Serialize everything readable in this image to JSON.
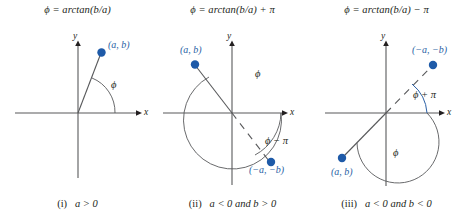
{
  "figure": {
    "accent_color": "#2a5fa5",
    "line_color": "#58595b",
    "text_color": "#231f20"
  },
  "panels": [
    {
      "id": "panel-1",
      "title": "ϕ = arctan(b/a)",
      "caption_index": "(i)",
      "caption_condition": "a > 0",
      "axis_x_label": "x",
      "axis_y_label": "y",
      "points": [
        {
          "name": "point-ab",
          "label": "(a, b)"
        }
      ],
      "angles": [
        {
          "name": "angle-phi",
          "label": "ϕ"
        }
      ]
    },
    {
      "id": "panel-2",
      "title": "ϕ = arctan(b/a) + π",
      "caption_index": "(ii)",
      "caption_condition": "a < 0 and b > 0",
      "axis_x_label": "x",
      "axis_y_label": "y",
      "points": [
        {
          "name": "point-ab",
          "label": "(a, b)"
        },
        {
          "name": "point-neg-ab",
          "label": "(−a, −b)"
        }
      ],
      "angles": [
        {
          "name": "angle-phi",
          "label": "ϕ"
        },
        {
          "name": "angle-phi-minus-pi",
          "label": "ϕ − π"
        }
      ]
    },
    {
      "id": "panel-3",
      "title": "ϕ = arctan(b/a) − π",
      "caption_index": "(iii)",
      "caption_condition": "a < 0 and b < 0",
      "axis_x_label": "x",
      "axis_y_label": "y",
      "points": [
        {
          "name": "point-neg-ab",
          "label": "(−a, −b)"
        },
        {
          "name": "point-ab",
          "label": "(a, b)"
        }
      ],
      "angles": [
        {
          "name": "angle-phi-plus-pi",
          "label": "ϕ + π"
        },
        {
          "name": "angle-phi",
          "label": "ϕ"
        }
      ]
    }
  ]
}
